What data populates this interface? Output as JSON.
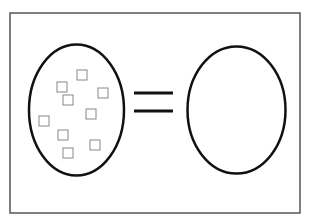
{
  "colors": {
    "background": "#ffffff",
    "frame": "#555555",
    "stroke": "#111111",
    "square": "#888888"
  },
  "frame": {
    "x": 10,
    "y": 13,
    "width": 290,
    "height": 200
  },
  "left_oval": {
    "cx": 76.5,
    "cy": 110,
    "rx": 47.5,
    "ry": 65.5
  },
  "right_oval": {
    "cx": 236.5,
    "cy": 110,
    "rx": 49,
    "ry": 63.5
  },
  "equals_sign": {
    "x1": 134,
    "x2": 173,
    "lines_y": [
      93,
      111
    ]
  },
  "squares": [
    {
      "x": 77,
      "y": 70
    },
    {
      "x": 57,
      "y": 82
    },
    {
      "x": 98,
      "y": 88
    },
    {
      "x": 63,
      "y": 95
    },
    {
      "x": 86,
      "y": 109
    },
    {
      "x": 39,
      "y": 116
    },
    {
      "x": 58,
      "y": 130
    },
    {
      "x": 90,
      "y": 140
    },
    {
      "x": 63,
      "y": 148
    }
  ],
  "square_size": 10
}
